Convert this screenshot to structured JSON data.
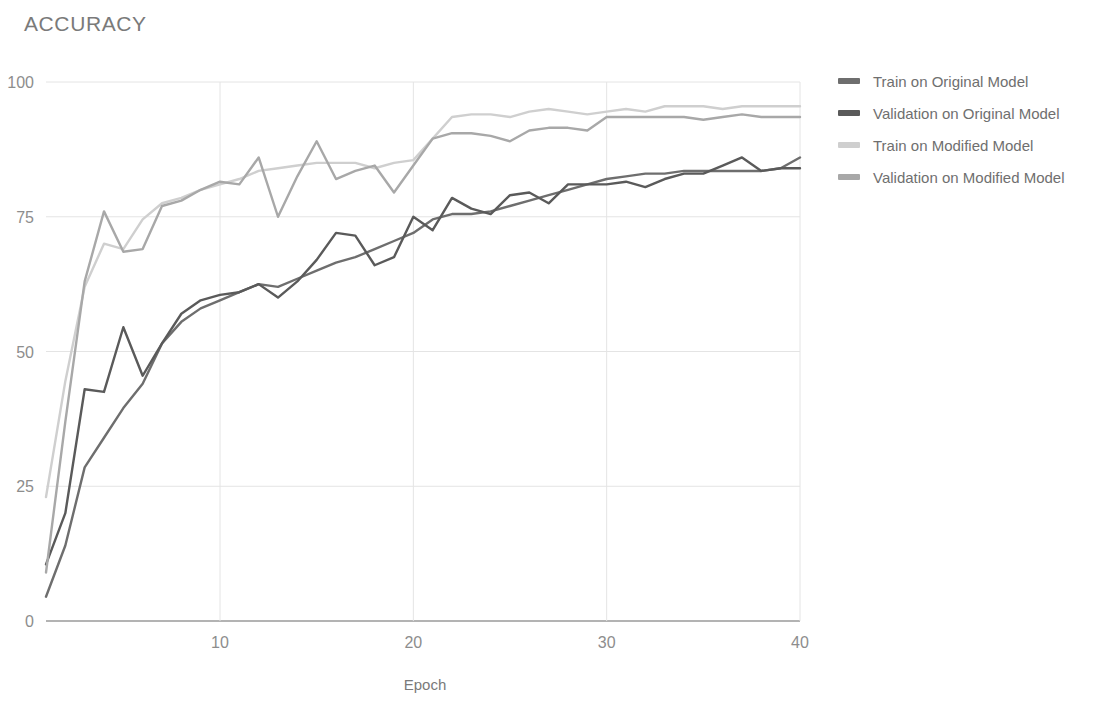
{
  "title": "ACCURACY",
  "colors": {
    "train_original": "#6e6e6e",
    "validation_original": "#5a5a5a",
    "train_modified": "#cfcfcf",
    "validation_modified": "#a8a8a8",
    "grid": "#e4e4e4",
    "axis": "#9a9a9a",
    "text": "#7a7a7a",
    "background": "#ffffff"
  },
  "legend": {
    "position": "right",
    "items": [
      {
        "label": "Train on Original Model",
        "color": "#6e6e6e",
        "key": "train_original"
      },
      {
        "label": "Validation on Original Model",
        "color": "#5a5a5a",
        "key": "validation_original"
      },
      {
        "label": "Train on Modified Model",
        "color": "#cfcfcf",
        "key": "train_modified"
      },
      {
        "label": "Validation on Modified Model",
        "color": "#a8a8a8",
        "key": "validation_modified"
      }
    ]
  },
  "chart_data": {
    "type": "line",
    "title": "ACCURACY",
    "xlabel": "Epoch",
    "ylabel": "",
    "xlim": [
      1,
      40
    ],
    "ylim": [
      0,
      100
    ],
    "xticks": [
      10,
      20,
      30,
      40
    ],
    "yticks": [
      0,
      25,
      50,
      75,
      100
    ],
    "grid": true,
    "x": [
      1,
      2,
      3,
      4,
      5,
      6,
      7,
      8,
      9,
      10,
      11,
      12,
      13,
      14,
      15,
      16,
      17,
      18,
      19,
      20,
      21,
      22,
      23,
      24,
      25,
      26,
      27,
      28,
      29,
      30,
      31,
      32,
      33,
      34,
      35,
      36,
      37,
      38,
      39,
      40
    ],
    "series": [
      {
        "name": "Train on Original Model",
        "color": "#6e6e6e",
        "values": [
          4.5,
          14.0,
          28.5,
          34.0,
          39.5,
          44.0,
          51.5,
          55.5,
          58.0,
          59.5,
          61.0,
          62.5,
          62.0,
          63.5,
          65.0,
          66.5,
          67.5,
          69.0,
          70.5,
          72.0,
          74.5,
          75.5,
          75.5,
          76.0,
          77.0,
          78.0,
          79.0,
          80.0,
          81.0,
          82.0,
          82.5,
          83.0,
          83.0,
          83.5,
          83.5,
          83.5,
          83.5,
          83.5,
          84.0,
          86.0
        ]
      },
      {
        "name": "Validation on Original Model",
        "color": "#5a5a5a",
        "values": [
          10.5,
          20.0,
          43.0,
          42.5,
          54.5,
          45.5,
          51.5,
          57.0,
          59.5,
          60.5,
          61.0,
          62.5,
          60.0,
          63.0,
          67.0,
          72.0,
          71.5,
          66.0,
          67.5,
          75.0,
          72.5,
          78.5,
          76.5,
          75.5,
          79.0,
          79.5,
          77.5,
          81.0,
          81.0,
          81.0,
          81.5,
          80.5,
          82.0,
          83.0,
          83.0,
          84.5,
          86.0,
          83.5,
          84.0,
          84.0
        ]
      },
      {
        "name": "Train on Modified Model",
        "color": "#cfcfcf",
        "values": [
          23.0,
          44.5,
          62.0,
          70.0,
          69.0,
          74.5,
          77.5,
          78.5,
          80.0,
          81.0,
          82.0,
          83.5,
          84.0,
          84.5,
          85.0,
          85.0,
          85.0,
          84.0,
          85.0,
          85.5,
          89.5,
          93.5,
          94.0,
          94.0,
          93.5,
          94.5,
          95.0,
          94.5,
          94.0,
          94.5,
          95.0,
          94.5,
          95.5,
          95.5,
          95.5,
          95.0,
          95.5,
          95.5,
          95.5,
          95.5
        ]
      },
      {
        "name": "Validation on Modified Model",
        "color": "#a8a8a8",
        "values": [
          9.0,
          37.0,
          63.0,
          76.0,
          68.5,
          69.0,
          77.0,
          78.0,
          80.0,
          81.5,
          81.0,
          86.0,
          75.0,
          82.5,
          89.0,
          82.0,
          83.5,
          84.5,
          79.5,
          84.5,
          89.5,
          90.5,
          90.5,
          90.0,
          89.0,
          91.0,
          91.5,
          91.5,
          91.0,
          93.5,
          93.5,
          93.5,
          93.5,
          93.5,
          93.0,
          93.5,
          94.0,
          93.5,
          93.5,
          93.5
        ]
      }
    ]
  }
}
